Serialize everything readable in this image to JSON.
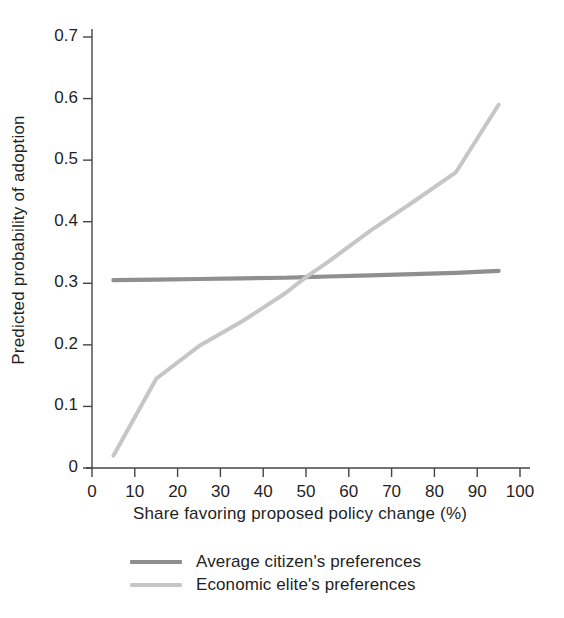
{
  "chart_data": {
    "type": "line",
    "title": "",
    "subtitle": "",
    "xlabel": "Share favoring proposed policy change (%)",
    "ylabel": "Predicted probability of adoption",
    "xlim": [
      0,
      100
    ],
    "ylim": [
      0,
      0.7
    ],
    "grid": false,
    "legend_position": "bottom",
    "xticks": [
      "0",
      "10",
      "20",
      "30",
      "40",
      "50",
      "60",
      "70",
      "80",
      "90",
      "100"
    ],
    "xtick_values": [
      0,
      10,
      20,
      30,
      40,
      50,
      60,
      70,
      80,
      90,
      100
    ],
    "yticks": [
      "0",
      "0.1",
      "0.2",
      "0.3",
      "0.4",
      "0.5",
      "0.6",
      "0.7"
    ],
    "ytick_values": [
      0,
      0.1,
      0.2,
      0.3,
      0.4,
      0.5,
      0.6,
      0.7
    ],
    "series": [
      {
        "name": "Average citizen's preferences",
        "color": "#8f8f8f",
        "x": [
          5,
          15,
          25,
          35,
          45,
          50,
          55,
          65,
          75,
          85,
          95
        ],
        "values": [
          0.305,
          0.306,
          0.307,
          0.308,
          0.309,
          0.31,
          0.311,
          0.313,
          0.315,
          0.317,
          0.32
        ]
      },
      {
        "name": "Economic elite's preferences",
        "color": "#c6c6c6",
        "x": [
          5,
          15,
          25,
          35,
          45,
          50,
          55,
          65,
          75,
          85,
          95
        ],
        "values": [
          0.02,
          0.145,
          0.198,
          0.238,
          0.283,
          0.31,
          0.334,
          0.385,
          0.432,
          0.48,
          0.59
        ]
      }
    ]
  },
  "legend": {
    "items": [
      {
        "label": "Average citizen's preferences",
        "color": "#8f8f8f"
      },
      {
        "label": "Economic elite's preferences",
        "color": "#c6c6c6"
      }
    ]
  },
  "axes": {
    "x_title": "Share favoring proposed policy change (%)",
    "y_title": "Predicted probability of adoption"
  }
}
